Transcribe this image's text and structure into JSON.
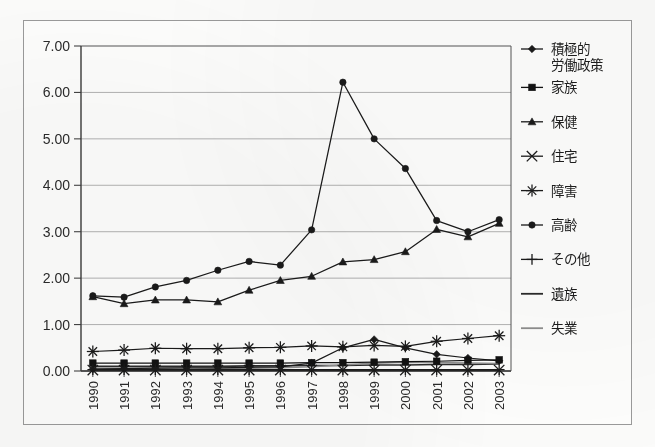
{
  "chart_data": {
    "type": "line",
    "title": "",
    "subtitle": "",
    "xlabel": "",
    "ylabel": "",
    "grid": true,
    "legend_position": "right",
    "ylim": [
      0,
      7
    ],
    "ytick_labels": [
      "7.00",
      "6.00",
      "5.00",
      "4.00",
      "3.00",
      "2.00",
      "1.00",
      "0.00"
    ],
    "ytick_values": [
      7,
      6,
      5,
      4,
      3,
      2,
      1,
      0
    ],
    "categories": [
      "1990",
      "1991",
      "1992",
      "1993",
      "1994",
      "1995",
      "1996",
      "1997",
      "1998",
      "1999",
      "2000",
      "2001",
      "2002",
      "2003"
    ],
    "series": [
      {
        "name": "積極的労働政策",
        "marker": "diamond",
        "color": "#1a1a1a",
        "values": [
          0.04,
          0.05,
          0.06,
          0.07,
          0.07,
          0.08,
          0.09,
          0.17,
          0.5,
          0.68,
          0.5,
          0.36,
          0.28,
          0.22
        ]
      },
      {
        "name": "家族",
        "marker": "square",
        "color": "#121212",
        "values": [
          0.17,
          0.17,
          0.17,
          0.17,
          0.17,
          0.17,
          0.17,
          0.18,
          0.18,
          0.19,
          0.2,
          0.21,
          0.23,
          0.24
        ]
      },
      {
        "name": "保健",
        "marker": "triangle",
        "color": "#1a1a1a",
        "values": [
          1.6,
          1.45,
          1.53,
          1.53,
          1.49,
          1.74,
          1.95,
          2.04,
          2.35,
          2.4,
          2.57,
          3.05,
          2.89,
          3.18
        ]
      },
      {
        "name": "住宅",
        "marker": "x",
        "color": "#1a1a1a",
        "values": [
          0.02,
          0.02,
          0.02,
          0.02,
          0.02,
          0.02,
          0.02,
          0.02,
          0.02,
          0.02,
          0.02,
          0.02,
          0.02,
          0.02
        ]
      },
      {
        "name": "障害",
        "marker": "asterisk",
        "color": "#1a1a1a",
        "values": [
          0.42,
          0.45,
          0.49,
          0.48,
          0.48,
          0.5,
          0.51,
          0.54,
          0.52,
          0.55,
          0.53,
          0.64,
          0.7,
          0.76
        ]
      },
      {
        "name": "高齢",
        "marker": "circle",
        "color": "#1a1a1a",
        "values": [
          1.62,
          1.59,
          1.81,
          1.95,
          2.17,
          2.36,
          2.28,
          3.04,
          6.22,
          5.0,
          4.36,
          3.24,
          3.0,
          3.26
        ]
      },
      {
        "name": "その他",
        "marker": "plus",
        "color": "#1a1a1a",
        "values": [
          0.03,
          0.03,
          0.03,
          0.03,
          0.03,
          0.03,
          0.03,
          0.03,
          0.03,
          0.03,
          0.03,
          0.03,
          0.03,
          0.03
        ]
      },
      {
        "name": "遺族",
        "marker": "none",
        "color": "#2b2b2b",
        "values": [
          0.1,
          0.1,
          0.1,
          0.1,
          0.1,
          0.11,
          0.11,
          0.12,
          0.12,
          0.13,
          0.13,
          0.14,
          0.14,
          0.15
        ]
      },
      {
        "name": "失業",
        "marker": "none",
        "color": "#8d8d8d",
        "values": [
          0.06,
          0.06,
          0.06,
          0.06,
          0.06,
          0.06,
          0.07,
          0.09,
          0.13,
          0.17,
          0.19,
          0.18,
          0.17,
          0.16
        ]
      }
    ]
  },
  "legend": {
    "entries": [
      {
        "label": "積極的",
        "label2": "労働政策"
      },
      {
        "label": "家族"
      },
      {
        "label": "保健"
      },
      {
        "label": "住宅"
      },
      {
        "label": "障害"
      },
      {
        "label": "高齢"
      },
      {
        "label": "その他"
      },
      {
        "label": "遺族"
      },
      {
        "label": "失業"
      }
    ]
  }
}
